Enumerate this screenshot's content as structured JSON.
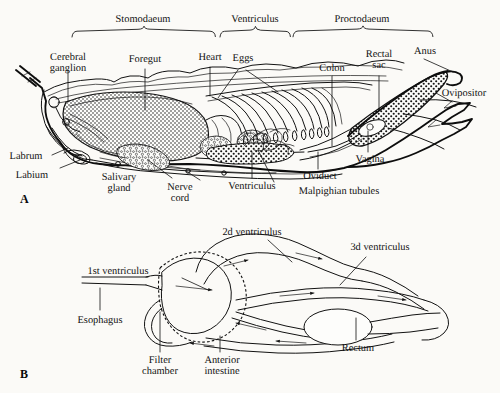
{
  "figure": {
    "background_color": "#fbfaf7",
    "ink_color": "#121212",
    "panels": [
      {
        "id": "A",
        "label": "A"
      },
      {
        "id": "B",
        "label": "B"
      }
    ]
  },
  "panel_a": {
    "panel_label": "A",
    "region_brackets": [
      {
        "label": "Stomodaeum",
        "x_start": 72,
        "x_end": 215
      },
      {
        "label": "Ventriculus",
        "x_start": 220,
        "x_end": 290
      },
      {
        "label": "Proctodaeum",
        "x_start": 293,
        "x_end": 432
      }
    ],
    "labels": [
      {
        "key": "cerebral_ganglion",
        "text_line1": "Cerebral",
        "text_line2": "ganglion"
      },
      {
        "key": "foregut",
        "text": "Foregut"
      },
      {
        "key": "heart",
        "text": "Heart"
      },
      {
        "key": "eggs",
        "text": "Eggs"
      },
      {
        "key": "colon",
        "text": "Colon"
      },
      {
        "key": "rectal_sac",
        "text_line1": "Rectal",
        "text_line2": "sac"
      },
      {
        "key": "anus",
        "text": "Anus"
      },
      {
        "key": "ovipositor",
        "text": "Ovipositor"
      },
      {
        "key": "vagina",
        "text": "Vagina"
      },
      {
        "key": "oviduct",
        "text": "Oviduct"
      },
      {
        "key": "malpighian_tubules",
        "text": "Malpighian tubules"
      },
      {
        "key": "ventriculus_lower",
        "text": "Ventriculus"
      },
      {
        "key": "nerve_cord",
        "text_line1": "Nerve",
        "text_line2": "cord"
      },
      {
        "key": "salivary_gland",
        "text_line1": "Salivary",
        "text_line2": "gland"
      },
      {
        "key": "labium",
        "text": "Labium"
      },
      {
        "key": "labrum",
        "text": "Labrum"
      }
    ],
    "text": {
      "stomodaeum": "Stomodaeum",
      "ventriculus_top": "Ventriculus",
      "proctodaeum": "Proctodaeum",
      "cerebral": "Cerebral",
      "ganglion": "ganglion",
      "foregut": "Foregut",
      "heart": "Heart",
      "eggs": "Eggs",
      "colon": "Colon",
      "rectal": "Rectal",
      "sac": "sac",
      "anus": "Anus",
      "ovipositor": "Ovipositor",
      "vagina": "Vagina",
      "oviduct": "Oviduct",
      "malpighian_tubules": "Malpighian tubules",
      "ventriculus_bottom": "Ventriculus",
      "nerve": "Nerve",
      "cord": "cord",
      "salivary": "Salivary",
      "gland": "gland",
      "labium": "Labium",
      "labrum": "Labrum"
    }
  },
  "panel_b": {
    "panel_label": "B",
    "text": {
      "second_ventriculus": "2d ventriculus",
      "third_ventriculus": "3d ventriculus",
      "first_ventriculus": "1st ventriculus",
      "esophagus": "Esophagus",
      "filter": "Filter",
      "chamber": "chamber",
      "anterior": "Anterior",
      "intestine": "intestine",
      "rectum": "Rectum"
    },
    "labels": [
      {
        "key": "second_ventriculus",
        "text": "2d ventriculus"
      },
      {
        "key": "third_ventriculus",
        "text": "3d ventriculus"
      },
      {
        "key": "first_ventriculus",
        "text": "1st ventriculus"
      },
      {
        "key": "esophagus",
        "text": "Esophagus"
      },
      {
        "key": "filter_chamber",
        "text_line1": "Filter",
        "text_line2": "chamber"
      },
      {
        "key": "anterior_intestine",
        "text_line1": "Anterior",
        "text_line2": "intestine"
      },
      {
        "key": "rectum",
        "text": "Rectum"
      }
    ],
    "flow_arrow_count": 8
  }
}
